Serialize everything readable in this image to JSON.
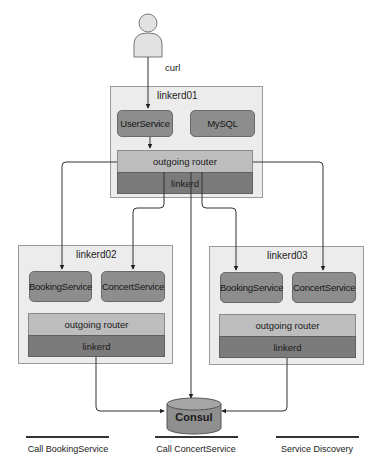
{
  "client": {
    "icon": "person-icon",
    "label": "curl"
  },
  "nodes": {
    "linkerd01": {
      "title": "linkerd01",
      "services": [
        "UserService",
        "MySQL"
      ],
      "router": "outgoing router",
      "proxy": "linkerd"
    },
    "linkerd02": {
      "title": "linkerd02",
      "services": [
        "BookingService",
        "ConcertService"
      ],
      "router": "outgoing router",
      "proxy": "linkerd"
    },
    "linkerd03": {
      "title": "linkerd03",
      "services": [
        "BookingService",
        "ConcertService"
      ],
      "router": "outgoing router",
      "proxy": "linkerd"
    }
  },
  "registry": {
    "icon": "database-icon",
    "label": "Consul"
  },
  "legend": [
    {
      "label": "Call BookingService"
    },
    {
      "label": "Call ConcertService"
    },
    {
      "label": "Service Discovery"
    }
  ],
  "colors": {
    "container_bg": "#ececec",
    "service_fill": "#8d8d8d",
    "router_fill": "#bdbdbd",
    "linkerd_fill": "#7b7b7b",
    "consul_fill": "#8f8f8f",
    "line": "#333333"
  }
}
